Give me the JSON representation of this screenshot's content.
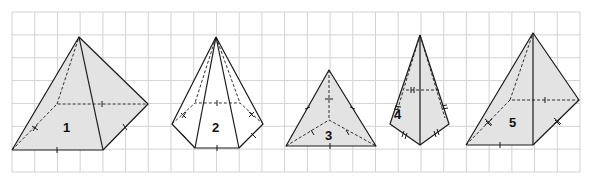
{
  "colors": {
    "grid": "#d2d2d2",
    "edge": "#1a1a1a",
    "shaded_fill": "#e3e3e3",
    "plain_fill": "#ffffff"
  },
  "figures": [
    {
      "id": "1",
      "label": "1",
      "type": "quadrilateral pyramid",
      "shaded": true,
      "base_sides": 4
    },
    {
      "id": "2",
      "label": "2",
      "type": "hexagonal pyramid",
      "shaded": false,
      "base_sides": 6
    },
    {
      "id": "3",
      "label": "3",
      "type": "triangular pyramid",
      "shaded": true,
      "base_sides": 3
    },
    {
      "id": "4",
      "label": "4",
      "type": "quadrilateral pyramid (kite base)",
      "shaded": true,
      "base_sides": 4
    },
    {
      "id": "5",
      "label": "5",
      "type": "quadrilateral pyramid",
      "shaded": true,
      "base_sides": 4
    }
  ]
}
